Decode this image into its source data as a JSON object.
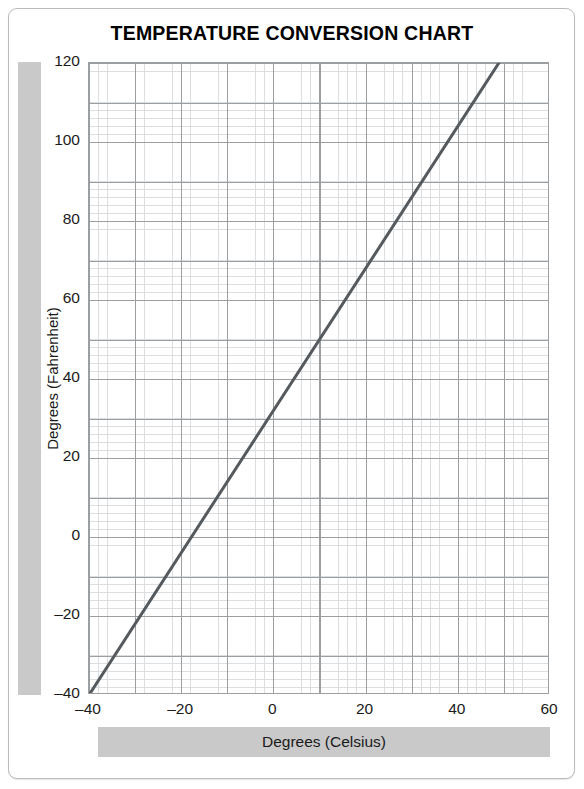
{
  "title": "TEMPERATURE CONVERSION CHART",
  "axes": {
    "y_band_label": "Degrees (Fahrenheit)",
    "x_band_label": "Degrees (Celsius)"
  },
  "colors": {
    "line": "#555a5e",
    "major_grid": "#9b9fa2",
    "minor_grid": "#dcdfe2",
    "band": "#c9c9c9",
    "card_border": "#b9bcbe",
    "background": "#ffffff",
    "text": "#1a1a1a"
  },
  "chart_data": {
    "type": "line",
    "title": "TEMPERATURE CONVERSION CHART",
    "xlabel": "Degrees (Celsius)",
    "ylabel": "Degrees (Fahrenheit)",
    "xlim": [
      -40,
      60
    ],
    "ylim": [
      -40,
      120
    ],
    "xticks": [
      -40,
      -20,
      0,
      20,
      40,
      60
    ],
    "yticks": [
      -40,
      -20,
      0,
      20,
      40,
      60,
      80,
      100,
      120
    ],
    "xtick_labels": [
      "–40",
      "–20",
      "0",
      "20",
      "40",
      "60"
    ],
    "ytick_labels": [
      "–40",
      "–20",
      "0",
      "20",
      "40",
      "60",
      "80",
      "100",
      "120"
    ],
    "x_major_step": 20,
    "y_major_step": 20,
    "x_grid_step": 10,
    "y_grid_step": 10,
    "x_minor_step": 2,
    "y_minor_step": 2,
    "grid": true,
    "legend": "none",
    "series": [
      {
        "name": "Celsius to Fahrenheit",
        "formula": "F = C × 9/5 + 32",
        "x": [
          -40,
          -30,
          -20,
          -10,
          0,
          10,
          20,
          30,
          40,
          48.9
        ],
        "values": [
          -40,
          -22,
          -4,
          14,
          32,
          50,
          68,
          86,
          104,
          120
        ],
        "clipped_at_top": true,
        "x_at_top_limit": 48.9
      }
    ]
  }
}
